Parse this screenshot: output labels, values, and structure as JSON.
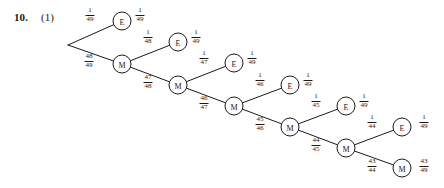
{
  "problem": {
    "number": "10.",
    "part": "(1)"
  },
  "chart_data": {
    "type": "diagram",
    "diagram_kind": "probability-tree",
    "title": "",
    "root": {
      "x": 68,
      "y": 45,
      "label": ""
    },
    "nodes": [
      {
        "id": "E1",
        "label": "E",
        "x": 122,
        "y": 21
      },
      {
        "id": "M1",
        "label": "M",
        "x": 122,
        "y": 64
      },
      {
        "id": "E2",
        "label": "E",
        "x": 178,
        "y": 42
      },
      {
        "id": "M2",
        "label": "M",
        "x": 178,
        "y": 85
      },
      {
        "id": "E3",
        "label": "E",
        "x": 234,
        "y": 63
      },
      {
        "id": "M3",
        "label": "M",
        "x": 234,
        "y": 106
      },
      {
        "id": "E4",
        "label": "E",
        "x": 290,
        "y": 85
      },
      {
        "id": "M4",
        "label": "M",
        "x": 290,
        "y": 127
      },
      {
        "id": "E5",
        "label": "E",
        "x": 346,
        "y": 106
      },
      {
        "id": "M5",
        "label": "M",
        "x": 346,
        "y": 148
      },
      {
        "id": "E6",
        "label": "E",
        "x": 402,
        "y": 127
      },
      {
        "id": "M6",
        "label": "M",
        "x": 402,
        "y": 168
      }
    ],
    "edges": [
      {
        "from": "root",
        "to": "E1"
      },
      {
        "from": "root",
        "to": "M1"
      },
      {
        "from": "M1",
        "to": "E2"
      },
      {
        "from": "M1",
        "to": "M2"
      },
      {
        "from": "M2",
        "to": "E3"
      },
      {
        "from": "M2",
        "to": "M3"
      },
      {
        "from": "M3",
        "to": "E4"
      },
      {
        "from": "M3",
        "to": "M4"
      },
      {
        "from": "M4",
        "to": "E5"
      },
      {
        "from": "M4",
        "to": "M5"
      },
      {
        "from": "M5",
        "to": "E6"
      },
      {
        "from": "M5",
        "to": "M6"
      }
    ],
    "edge_labels": [
      {
        "id": "p-root-E1",
        "numerator": "1",
        "denominator": "49",
        "x": 90,
        "y": 15
      },
      {
        "id": "p-root-M1",
        "numerator": "48",
        "denominator": "49",
        "x": 89,
        "y": 61
      },
      {
        "id": "p-M1-E2",
        "numerator": "1",
        "denominator": "48",
        "x": 148,
        "y": 37
      },
      {
        "id": "p-M1-M2",
        "numerator": "47",
        "denominator": "48",
        "x": 148,
        "y": 82
      },
      {
        "id": "p-M2-E3",
        "numerator": "1",
        "denominator": "47",
        "x": 204,
        "y": 58
      },
      {
        "id": "p-M2-M3",
        "numerator": "46",
        "denominator": "47",
        "x": 204,
        "y": 103
      },
      {
        "id": "p-M3-E4",
        "numerator": "1",
        "denominator": "46",
        "x": 260,
        "y": 80
      },
      {
        "id": "p-M3-M4",
        "numerator": "45",
        "denominator": "46",
        "x": 260,
        "y": 124
      },
      {
        "id": "p-M4-E5",
        "numerator": "1",
        "denominator": "45",
        "x": 316,
        "y": 101
      },
      {
        "id": "p-M4-M5",
        "numerator": "44",
        "denominator": "45",
        "x": 316,
        "y": 145
      },
      {
        "id": "p-M5-E6",
        "numerator": "1",
        "denominator": "44",
        "x": 372,
        "y": 122
      },
      {
        "id": "p-M5-M6",
        "numerator": "43",
        "denominator": "44",
        "x": 372,
        "y": 166
      }
    ],
    "outcome_labels": [
      {
        "id": "out-E1",
        "numerator": "1",
        "denominator": "49",
        "x": 140,
        "y": 15
      },
      {
        "id": "out-E2",
        "numerator": "1",
        "denominator": "49",
        "x": 196,
        "y": 37
      },
      {
        "id": "out-E3",
        "numerator": "1",
        "denominator": "49",
        "x": 252,
        "y": 58
      },
      {
        "id": "out-E4",
        "numerator": "1",
        "denominator": "49",
        "x": 308,
        "y": 80
      },
      {
        "id": "out-E5",
        "numerator": "1",
        "denominator": "49",
        "x": 364,
        "y": 101
      },
      {
        "id": "out-E6",
        "numerator": "1",
        "denominator": "49",
        "x": 424,
        "y": 122
      },
      {
        "id": "out-M6",
        "numerator": "43",
        "denominator": "49",
        "x": 424,
        "y": 166
      }
    ],
    "style": {
      "node_radius": 9,
      "stroke": "#1a1a1a",
      "stroke_width": 1,
      "node_fill": "#ffffff",
      "background": "#ffffff"
    }
  }
}
